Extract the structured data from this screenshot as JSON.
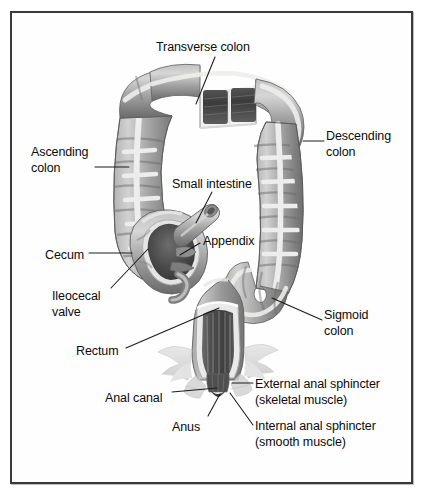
{
  "figure": {
    "frame": {
      "border_color": "#3a3a3c",
      "background": "#fefefe"
    }
  },
  "palette": {
    "colon_light": "#cfcfcf",
    "colon_mid": "#9b9b9b",
    "colon_dark": "#6f6f6f",
    "taenia": "#eaeaea",
    "lumen_dark": "#4a4a4a",
    "lumen_darkest": "#2f2f2f",
    "muscle_pale": "#d9d9d9",
    "leader_line": "#1a1a1a",
    "text": "#0b0b0b"
  },
  "labels": [
    {
      "id": "transverse-colon",
      "text": "Transverse colon",
      "x": 156,
      "y": 40,
      "lines": 1
    },
    {
      "id": "descending-colon",
      "text": "Descending\ncolon",
      "x": 326,
      "y": 129,
      "lines": 2
    },
    {
      "id": "ascending-colon",
      "text": "Ascending\ncolon",
      "x": 31,
      "y": 145,
      "lines": 2
    },
    {
      "id": "small-intestine",
      "text": "Small intestine",
      "x": 172,
      "y": 177,
      "lines": 1
    },
    {
      "id": "appendix",
      "text": "Appendix",
      "x": 203,
      "y": 234,
      "lines": 1
    },
    {
      "id": "cecum",
      "text": "Cecum",
      "x": 45,
      "y": 248,
      "lines": 1
    },
    {
      "id": "ileocecal-valve",
      "text": "Ileocecal\nvalve",
      "x": 52,
      "y": 289,
      "lines": 2
    },
    {
      "id": "sigmoid-colon",
      "text": "Sigmoid\ncolon",
      "x": 324,
      "y": 308,
      "lines": 2
    },
    {
      "id": "rectum",
      "text": "Rectum",
      "x": 76,
      "y": 344,
      "lines": 1
    },
    {
      "id": "external-anal-sphincter",
      "text": "External anal sphincter\n(skeletal muscle)",
      "x": 255,
      "y": 377,
      "lines": 2
    },
    {
      "id": "anal-canal",
      "text": "Anal canal",
      "x": 105,
      "y": 391,
      "lines": 1
    },
    {
      "id": "internal-anal-sphincter",
      "text": "Internal anal sphincter\n(smooth muscle)",
      "x": 255,
      "y": 419,
      "lines": 2
    },
    {
      "id": "anus",
      "text": "Anus",
      "x": 172,
      "y": 420,
      "lines": 1
    }
  ],
  "leaders": [
    {
      "id": "leader-transverse-colon",
      "path": "M 215 57 L 196 104"
    },
    {
      "id": "leader-descending-colon",
      "path": "M 324 141 L 303 141"
    },
    {
      "id": "leader-ascending-colon",
      "path": "M 95 167 L 129 167"
    },
    {
      "id": "leader-small-intestine",
      "path": "M 212 192 L 196 223"
    },
    {
      "id": "leader-appendix",
      "path": "M 200 243 L 180 255"
    },
    {
      "id": "leader-cecum",
      "path": "M 89 253 L 132 253"
    },
    {
      "id": "leader-ileocecal-valve",
      "path": "M 111 288 L 148 249"
    },
    {
      "id": "leader-sigmoid-colon",
      "path": "M 322 320 L 272 298"
    },
    {
      "id": "leader-rectum",
      "path": "M 126 348 L 219 308"
    },
    {
      "id": "leader-external-anal-sphincter",
      "path": "M 253 383 L 232 383"
    },
    {
      "id": "leader-internal-anal-sphincter",
      "path": "M 253 425 L 230 393"
    },
    {
      "id": "leader-anal-canal",
      "path": "M 172 392 L 217 388"
    },
    {
      "id": "leader-anus",
      "path": "M 208 416 L 220 394"
    }
  ],
  "chart_data": {
    "type": "diagram",
    "structures": [
      "Transverse colon",
      "Descending colon",
      "Ascending colon",
      "Small intestine",
      "Appendix",
      "Cecum",
      "Ileocecal valve",
      "Sigmoid colon",
      "Rectum",
      "External anal sphincter (skeletal muscle)",
      "Anal canal",
      "Internal anal sphincter (smooth muscle)",
      "Anus"
    ],
    "cutaway_sections": [
      "Transverse colon",
      "Cecum",
      "Rectum and anal canal"
    ]
  }
}
